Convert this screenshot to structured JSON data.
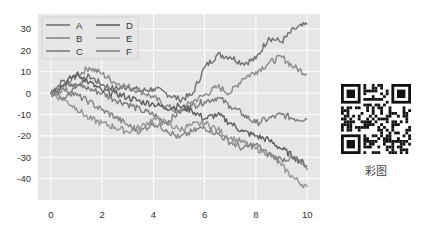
{
  "chart_data": {
    "type": "line",
    "title": "",
    "xlabel": "",
    "ylabel": "",
    "xlim": [
      -0.5,
      10.5
    ],
    "ylim": [
      -50,
      37
    ],
    "xticks": [
      0,
      2,
      4,
      6,
      8,
      10
    ],
    "yticks": [
      30,
      20,
      10,
      0,
      -10,
      -20,
      -30,
      -40
    ],
    "grid": true,
    "legend_position": "upper left",
    "legend_columns": 2,
    "x": [
      0,
      0.5,
      1,
      1.5,
      2,
      2.5,
      3,
      3.5,
      4,
      4.5,
      5,
      5.5,
      6,
      6.5,
      7,
      7.5,
      8,
      8.5,
      9,
      9.5,
      10
    ],
    "series": [
      {
        "name": "A",
        "color": "#6f6f6f",
        "values": [
          0,
          6,
          3,
          8,
          4,
          2,
          3,
          1,
          2,
          0,
          -3,
          -1,
          12,
          18,
          17,
          14,
          16,
          26,
          24,
          30,
          32
        ]
      },
      {
        "name": "B",
        "color": "#8a8a8a",
        "values": [
          0,
          3,
          8,
          12,
          9,
          5,
          3,
          1,
          -2,
          -6,
          -9,
          -4,
          -1,
          3,
          0,
          7,
          10,
          14,
          17,
          12,
          9
        ]
      },
      {
        "name": "C",
        "color": "#7c7c7c",
        "values": [
          0,
          -2,
          4,
          2,
          0,
          -3,
          -5,
          -8,
          -10,
          -14,
          -9,
          -6,
          -4,
          -2,
          -6,
          -10,
          -14,
          -12,
          -10,
          -12,
          -12
        ]
      },
      {
        "name": "D",
        "color": "#5e5e5e",
        "values": [
          0,
          4,
          9,
          5,
          1,
          0,
          -2,
          -4,
          -5,
          -7,
          -6,
          -8,
          -12,
          -10,
          -14,
          -18,
          -20,
          -22,
          -26,
          -30,
          -34
        ]
      },
      {
        "name": "E",
        "color": "#959595",
        "values": [
          0,
          -3,
          -7,
          -12,
          -14,
          -16,
          -18,
          -16,
          -12,
          -14,
          -17,
          -15,
          -14,
          -17,
          -21,
          -23,
          -26,
          -28,
          -34,
          -40,
          -44
        ]
      },
      {
        "name": "F",
        "color": "#858585",
        "values": [
          0,
          2,
          -1,
          -4,
          -8,
          -11,
          -15,
          -18,
          -14,
          -17,
          -21,
          -18,
          -16,
          -19,
          -23,
          -26,
          -24,
          -29,
          -31,
          -30,
          -36
        ]
      }
    ]
  },
  "legend": {
    "items": [
      {
        "label": "A",
        "color": "#6f6f6f"
      },
      {
        "label": "B",
        "color": "#8a8a8a"
      },
      {
        "label": "C",
        "color": "#7c7c7c"
      },
      {
        "label": "D",
        "color": "#5e5e5e"
      },
      {
        "label": "E",
        "color": "#959595"
      },
      {
        "label": "F",
        "color": "#858585"
      }
    ]
  },
  "qr": {
    "caption": "彩图"
  },
  "style": {
    "plot_background": "#e6e6e6",
    "grid_color": "#ffffff"
  }
}
